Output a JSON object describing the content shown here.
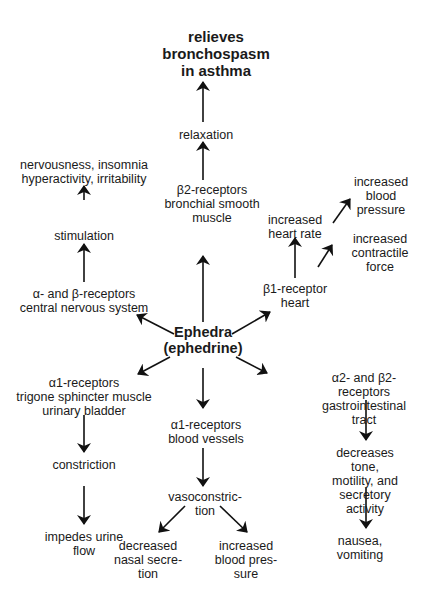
{
  "diagram": {
    "center": {
      "label": "Ephedra\n(ephedrine)"
    },
    "outcome_top": {
      "label": "relieves\nbronchospasm\nin asthma"
    },
    "relaxation": {
      "label": "relaxation"
    },
    "beta2_bronchial": {
      "label": "β2-receptors\nbronchial smooth\nmuscle"
    },
    "cns_effects": {
      "label": "nervousness, insomnia\nhyperactivity, irritability"
    },
    "stimulation": {
      "label": "stimulation"
    },
    "alpha_beta_cns": {
      "label": "α- and β-receptors\ncentral nervous system"
    },
    "bp_up_heart": {
      "label": "increased\nblood pressure"
    },
    "heart_rate": {
      "label": "increased\nheart rate"
    },
    "contractile_force": {
      "label": "increased\ncontractile force"
    },
    "beta1_heart": {
      "label": "β1-receptor\nheart"
    },
    "alpha1_bladder": {
      "label": "α1-receptors\ntrigone sphincter muscle\nurinary bladder"
    },
    "constriction": {
      "label": "constriction"
    },
    "impedes_urine": {
      "label": "impedes urine\nflow"
    },
    "alpha1_vessels": {
      "label": "α1-receptors\nblood vessels"
    },
    "vasoconstriction": {
      "label": "vasoconstric-\ntion"
    },
    "nasal_secretion": {
      "label": "decreased\nnasal secre-\ntion"
    },
    "bp_up_vessels": {
      "label": "increased\nblood pres-\nsure"
    },
    "alpha2_beta2_gi": {
      "label": "α2- and β2- receptors\ngastrointestinal tract"
    },
    "gi_decrease": {
      "label": "decreases tone,\nmotility, and\nsecretory activity"
    },
    "nausea": {
      "label": "nausea,\nvomiting"
    }
  },
  "colors": {
    "text": "#1a1a1a",
    "arrow": "#111111",
    "background": "#ffffff"
  }
}
